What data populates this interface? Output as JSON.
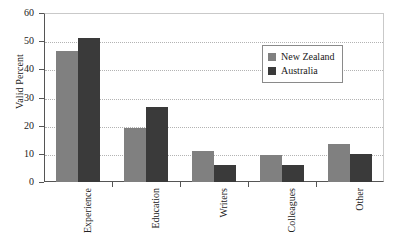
{
  "chart_data": {
    "type": "bar",
    "title": "",
    "subtitle": "",
    "xlabel": "",
    "ylabel": "Valid Percent",
    "ylim": [
      0,
      60
    ],
    "yticks": [
      0,
      10,
      20,
      30,
      40,
      50,
      60
    ],
    "ytick_labels": [
      "0",
      "10",
      "20",
      "30",
      "40",
      "50",
      "60"
    ],
    "grid": true,
    "grid_axis": "y",
    "grid_style": "dotted",
    "legend_position": "upper-right-inside",
    "categories": [
      "Experience",
      "Education",
      "Writers",
      "Colleagues",
      "Other"
    ],
    "series": [
      {
        "name": "New Zealand",
        "color": "#808080",
        "values": [
          46.5,
          19,
          11,
          9.5,
          13.5
        ]
      },
      {
        "name": "Australia",
        "color": "#3a3a3a",
        "values": [
          51,
          26.5,
          6,
          6,
          10
        ]
      }
    ]
  },
  "legend": {
    "entries": [
      {
        "label": "New Zealand",
        "color": "#808080"
      },
      {
        "label": "Australia",
        "color": "#3a3a3a"
      }
    ]
  },
  "colors": {
    "series_new_zealand": "#808080",
    "series_australia": "#3a3a3a",
    "axis": "#555555",
    "gridline": "#b3b3b3",
    "plot_border": "#c9c9c9",
    "background": "#ffffff",
    "text": "#1a1a1a"
  }
}
